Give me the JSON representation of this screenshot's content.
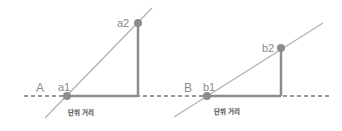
{
  "diagram": {
    "baseline": {
      "style": "dashed",
      "color": "#333333"
    },
    "colors": {
      "line": "#a8a8a8",
      "leg": "#8c8c8c",
      "point": "#8c8c8c"
    },
    "panels": [
      {
        "name": "A",
        "label": "A",
        "point1": "a1",
        "point2": "a2",
        "unit_label": "단위 거리"
      },
      {
        "name": "B",
        "label": "B",
        "point1": "b1",
        "point2": "b2",
        "unit_label": "단위 거리"
      }
    ]
  }
}
